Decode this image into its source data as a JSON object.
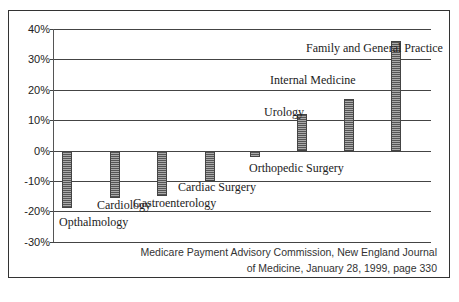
{
  "chart_data": {
    "type": "bar",
    "title": "",
    "xlabel": "",
    "ylabel": "",
    "ylim": [
      -30,
      40
    ],
    "yticks": [
      "40%",
      "30%",
      "20%",
      "10%",
      "0%",
      "-10%",
      "-20%",
      "-30%"
    ],
    "grid": true,
    "categories": [
      "Opthalmology",
      "Cardiology",
      "Gastroenterology",
      "Cardiac Surgery",
      "Orthopedic Surgery",
      "Urology",
      "Internal Medicine",
      "Family and General Practice"
    ],
    "values": [
      -19,
      -15.5,
      -15,
      -10,
      -2,
      12,
      17,
      36
    ],
    "unit": "%"
  },
  "source": {
    "line1": "Medicare Payment Advisory Commission, New England Journal",
    "line2": "of Medicine, January 28, 1999, page 330"
  }
}
